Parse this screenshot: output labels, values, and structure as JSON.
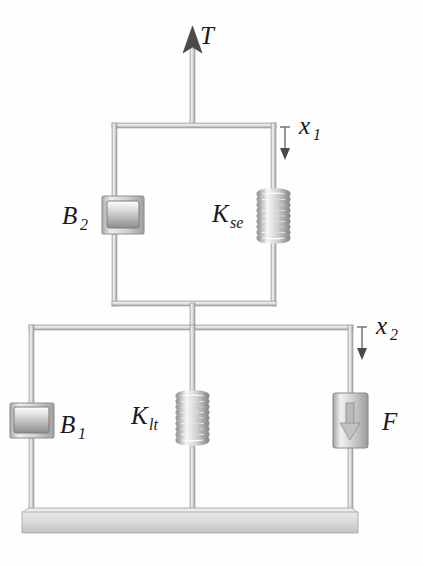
{
  "diagram": {
    "background_color": "#fefefe",
    "line_color": "#9a9a9a",
    "label_color": "#1a1a1a",
    "metal_light": "#f2f2f2",
    "metal_mid": "#c9c9c9",
    "metal_dark": "#8f8f8f",
    "labels": {
      "torque": "T",
      "damper_upper": "B",
      "damper_upper_sub": "2",
      "spring_upper": "K",
      "spring_upper_sub": "se",
      "displacement_upper": "x",
      "displacement_upper_sub": "1",
      "damper_lower": "B",
      "damper_lower_sub": "1",
      "spring_lower": "K",
      "spring_lower_sub": "lt",
      "force": "F",
      "displacement_lower": "x",
      "displacement_lower_sub": "2"
    },
    "components": [
      {
        "name": "input-force-arrow",
        "symbol": "T",
        "kind": "force-arrow",
        "direction": "up"
      },
      {
        "name": "damper-b2",
        "symbol": "B2",
        "kind": "damper",
        "orientation": "horizontal-piston"
      },
      {
        "name": "spring-kse",
        "symbol": "Kse",
        "kind": "spring",
        "coils": 9
      },
      {
        "name": "displacement-x1",
        "symbol": "x1",
        "kind": "displacement",
        "direction": "down"
      },
      {
        "name": "damper-b1",
        "symbol": "B1",
        "kind": "damper",
        "orientation": "horizontal-piston"
      },
      {
        "name": "spring-klt",
        "symbol": "Klt",
        "kind": "spring",
        "coils": 9
      },
      {
        "name": "actuator-f",
        "symbol": "F",
        "kind": "actuator",
        "direction": "down"
      },
      {
        "name": "displacement-x2",
        "symbol": "x2",
        "kind": "displacement",
        "direction": "down"
      },
      {
        "name": "ground-base",
        "symbol": "",
        "kind": "ground",
        "orientation": "horizontal"
      }
    ]
  }
}
